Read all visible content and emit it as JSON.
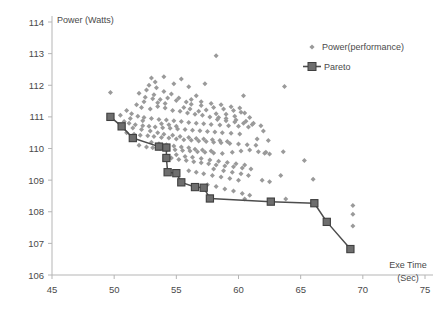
{
  "chart_data": {
    "type": "scatter",
    "title": "",
    "xlabel": "Exe Time (Sec)",
    "ylabel": "Power (Watts)",
    "xlim": [
      45,
      75
    ],
    "ylim": [
      106,
      114
    ],
    "xticks": [
      45,
      50,
      55,
      60,
      65,
      70,
      75
    ],
    "yticks": [
      106,
      107,
      108,
      109,
      110,
      111,
      112,
      113,
      114
    ],
    "grid": false,
    "legend_position": "top-right",
    "marker_color": "#9a9a9a",
    "pareto_color": "#4d4d4d",
    "series": [
      {
        "name": "Power(performance)",
        "type": "scatter",
        "marker": "diamond",
        "color": "#9a9a9a",
        "points": [
          [
            49.7,
            111.77
          ],
          [
            58.2,
            112.93
          ],
          [
            63.7,
            111.96
          ],
          [
            53.0,
            112.23
          ],
          [
            54.0,
            112.27
          ],
          [
            55.4,
            112.2
          ],
          [
            57.3,
            112.05
          ],
          [
            52.8,
            112.0
          ],
          [
            53.4,
            111.92
          ],
          [
            56.6,
            111.67
          ],
          [
            60.4,
            111.67
          ],
          [
            52.5,
            111.62
          ],
          [
            53.1,
            111.57
          ],
          [
            53.7,
            111.55
          ],
          [
            54.3,
            111.6
          ],
          [
            55.0,
            111.52
          ],
          [
            55.8,
            111.47
          ],
          [
            56.2,
            111.4
          ],
          [
            57.0,
            111.36
          ],
          [
            58.0,
            111.3
          ],
          [
            58.8,
            111.25
          ],
          [
            59.6,
            111.2
          ],
          [
            60.2,
            111.15
          ],
          [
            51.8,
            111.38
          ],
          [
            52.2,
            111.3
          ],
          [
            52.9,
            111.25
          ],
          [
            53.5,
            111.33
          ],
          [
            54.1,
            111.28
          ],
          [
            54.7,
            111.2
          ],
          [
            55.3,
            111.18
          ],
          [
            55.9,
            111.12
          ],
          [
            56.5,
            111.08
          ],
          [
            57.1,
            111.05
          ],
          [
            57.7,
            111.0
          ],
          [
            58.4,
            110.98
          ],
          [
            59.0,
            110.95
          ],
          [
            59.8,
            110.9
          ],
          [
            60.6,
            110.86
          ],
          [
            61.2,
            110.8
          ],
          [
            51.4,
            111.1
          ],
          [
            51.9,
            111.02
          ],
          [
            52.4,
            110.98
          ],
          [
            53.0,
            110.95
          ],
          [
            53.6,
            110.92
          ],
          [
            54.2,
            110.9
          ],
          [
            54.8,
            110.88
          ],
          [
            55.4,
            110.85
          ],
          [
            56.0,
            110.82
          ],
          [
            56.6,
            110.8
          ],
          [
            57.2,
            110.78
          ],
          [
            57.8,
            110.76
          ],
          [
            58.5,
            110.74
          ],
          [
            59.2,
            110.72
          ],
          [
            60.0,
            110.7
          ],
          [
            60.8,
            110.68
          ],
          [
            51.2,
            110.8
          ],
          [
            51.7,
            110.75
          ],
          [
            52.3,
            110.72
          ],
          [
            52.8,
            110.7
          ],
          [
            53.3,
            110.68
          ],
          [
            53.9,
            110.66
          ],
          [
            54.5,
            110.64
          ],
          [
            55.1,
            110.62
          ],
          [
            55.7,
            110.6
          ],
          [
            56.3,
            110.58
          ],
          [
            56.9,
            110.56
          ],
          [
            57.5,
            110.54
          ],
          [
            58.1,
            110.52
          ],
          [
            58.7,
            110.5
          ],
          [
            59.4,
            110.48
          ],
          [
            60.1,
            110.46
          ],
          [
            62.0,
            110.55
          ],
          [
            61.5,
            110.3
          ],
          [
            62.4,
            110.25
          ],
          [
            51.0,
            110.5
          ],
          [
            51.6,
            110.45
          ],
          [
            52.1,
            110.42
          ],
          [
            52.7,
            110.4
          ],
          [
            53.2,
            110.38
          ],
          [
            53.8,
            110.35
          ],
          [
            54.4,
            110.33
          ],
          [
            55.0,
            110.3
          ],
          [
            55.6,
            110.28
          ],
          [
            56.2,
            110.26
          ],
          [
            56.8,
            110.24
          ],
          [
            57.4,
            110.22
          ],
          [
            58.0,
            110.2
          ],
          [
            58.6,
            110.18
          ],
          [
            59.3,
            110.16
          ],
          [
            60.0,
            110.14
          ],
          [
            60.7,
            110.12
          ],
          [
            61.4,
            110.1
          ],
          [
            52.0,
            110.1
          ],
          [
            52.6,
            110.05
          ],
          [
            53.1,
            110.02
          ],
          [
            53.7,
            110.0
          ],
          [
            54.3,
            109.98
          ],
          [
            54.9,
            109.96
          ],
          [
            55.5,
            109.94
          ],
          [
            56.1,
            109.92
          ],
          [
            56.7,
            109.9
          ],
          [
            57.3,
            109.88
          ],
          [
            58.0,
            109.86
          ],
          [
            58.7,
            109.84
          ],
          [
            59.5,
            109.88
          ],
          [
            60.2,
            109.92
          ],
          [
            60.9,
            109.95
          ],
          [
            62.1,
            109.85
          ],
          [
            62.5,
            109.83
          ],
          [
            63.6,
            109.9
          ],
          [
            54.6,
            109.7
          ],
          [
            55.2,
            109.65
          ],
          [
            55.8,
            109.62
          ],
          [
            56.4,
            109.58
          ],
          [
            57.0,
            109.55
          ],
          [
            57.6,
            109.52
          ],
          [
            58.2,
            109.48
          ],
          [
            58.9,
            109.45
          ],
          [
            59.6,
            109.42
          ],
          [
            60.3,
            109.38
          ],
          [
            61.0,
            109.35
          ],
          [
            65.3,
            109.62
          ],
          [
            63.4,
            109.15
          ],
          [
            56.0,
            109.3
          ],
          [
            56.6,
            109.25
          ],
          [
            57.2,
            109.2
          ],
          [
            57.9,
            109.15
          ],
          [
            58.6,
            109.1
          ],
          [
            59.3,
            109.05
          ],
          [
            60.0,
            109.0
          ],
          [
            61.9,
            109.0
          ],
          [
            62.5,
            108.95
          ],
          [
            66.0,
            109.03
          ],
          [
            57.5,
            108.85
          ],
          [
            58.2,
            108.8
          ],
          [
            58.9,
            108.72
          ],
          [
            59.6,
            108.66
          ],
          [
            60.3,
            108.58
          ],
          [
            60.9,
            108.52
          ],
          [
            60.5,
            108.4
          ],
          [
            63.8,
            108.4
          ],
          [
            69.2,
            108.2
          ],
          [
            69.2,
            107.92
          ],
          [
            69.2,
            107.55
          ],
          [
            50.5,
            111.05
          ],
          [
            51.0,
            111.2
          ],
          [
            51.3,
            110.95
          ],
          [
            52.0,
            111.75
          ],
          [
            52.6,
            111.85
          ],
          [
            53.2,
            111.7
          ],
          [
            54.0,
            111.8
          ],
          [
            54.6,
            111.72
          ],
          [
            55.2,
            111.6
          ],
          [
            53.5,
            111.45
          ],
          [
            54.1,
            111.42
          ],
          [
            52.4,
            111.48
          ],
          [
            55.6,
            111.3
          ],
          [
            56.1,
            111.25
          ],
          [
            56.8,
            111.18
          ],
          [
            57.4,
            111.22
          ],
          [
            58.2,
            111.1
          ],
          [
            59.0,
            111.08
          ],
          [
            59.7,
            111.02
          ],
          [
            60.5,
            111.12
          ],
          [
            60.9,
            110.98
          ],
          [
            52.2,
            110.6
          ],
          [
            52.9,
            110.55
          ],
          [
            53.5,
            110.5
          ],
          [
            54.0,
            110.45
          ],
          [
            54.7,
            110.42
          ],
          [
            55.3,
            110.38
          ],
          [
            56.0,
            110.35
          ],
          [
            56.6,
            110.32
          ],
          [
            57.2,
            110.3
          ],
          [
            57.9,
            110.28
          ],
          [
            58.5,
            110.25
          ],
          [
            59.1,
            110.22
          ],
          [
            53.0,
            110.2
          ],
          [
            53.6,
            110.15
          ],
          [
            54.2,
            110.12
          ],
          [
            54.8,
            110.08
          ],
          [
            55.4,
            110.05
          ],
          [
            56.0,
            110.02
          ],
          [
            56.5,
            109.98
          ],
          [
            57.1,
            109.95
          ],
          [
            57.8,
            109.92
          ],
          [
            55.0,
            109.8
          ],
          [
            55.7,
            109.75
          ],
          [
            56.3,
            109.72
          ],
          [
            57.0,
            109.68
          ],
          [
            57.7,
            109.64
          ],
          [
            58.4,
            109.6
          ],
          [
            59.1,
            109.56
          ],
          [
            59.8,
            109.52
          ],
          [
            60.5,
            109.48
          ],
          [
            58.0,
            109.35
          ],
          [
            58.8,
            109.3
          ],
          [
            59.5,
            109.25
          ],
          [
            60.2,
            109.2
          ],
          [
            60.8,
            109.15
          ],
          [
            61.6,
            109.9
          ],
          [
            62.2,
            109.88
          ],
          [
            50.8,
            110.85
          ],
          [
            51.5,
            110.65
          ],
          [
            52.3,
            110.88
          ],
          [
            53.8,
            110.78
          ],
          [
            54.4,
            110.75
          ],
          [
            55.0,
            110.7
          ],
          [
            58.3,
            110.92
          ],
          [
            59.0,
            110.88
          ],
          [
            59.7,
            110.84
          ],
          [
            60.4,
            110.8
          ],
          [
            61.1,
            110.76
          ],
          [
            61.8,
            110.72
          ],
          [
            56.2,
            111.55
          ],
          [
            57.0,
            111.48
          ],
          [
            57.8,
            111.42
          ],
          [
            58.6,
            111.38
          ],
          [
            59.4,
            111.32
          ],
          [
            60.1,
            111.28
          ],
          [
            53.3,
            112.1
          ],
          [
            54.8,
            112.05
          ],
          [
            56.0,
            111.95
          ]
        ]
      },
      {
        "name": "Pareto",
        "type": "line",
        "marker": "square",
        "color": "#4d4d4d",
        "points": [
          [
            49.7,
            111.0
          ],
          [
            50.6,
            110.7
          ],
          [
            51.5,
            110.33
          ],
          [
            53.6,
            110.06
          ],
          [
            54.2,
            110.03
          ],
          [
            54.2,
            109.7
          ],
          [
            54.3,
            109.25
          ],
          [
            55.0,
            109.22
          ],
          [
            55.4,
            108.93
          ],
          [
            56.5,
            108.78
          ],
          [
            57.2,
            108.76
          ],
          [
            57.7,
            108.42
          ],
          [
            62.6,
            108.32
          ],
          [
            66.1,
            108.27
          ],
          [
            67.1,
            107.68
          ],
          [
            69.0,
            106.82
          ]
        ]
      }
    ]
  },
  "legend": {
    "items": [
      {
        "label": "Power(performance)",
        "marker": "diamond",
        "color": "#9a9a9a"
      },
      {
        "label": "Pareto",
        "marker": "line-square",
        "color": "#4d4d4d"
      }
    ]
  },
  "axes": {
    "y_title": "Power (Watts)",
    "x_title_line1": "Exe Time",
    "x_title_line2": "(Sec)"
  }
}
